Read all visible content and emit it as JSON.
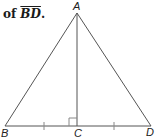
{
  "caption": {
    "prefix": "of ",
    "segment": "BD",
    "suffix": "."
  },
  "figure": {
    "type": "isosceles triangle with altitude",
    "points": {
      "A": {
        "label": "A",
        "x": 77,
        "y": 13
      },
      "B": {
        "label": "B",
        "x": 5,
        "y": 126
      },
      "C": {
        "label": "C",
        "x": 77,
        "y": 126
      },
      "D": {
        "label": "D",
        "x": 151,
        "y": 126
      }
    },
    "marks": {
      "right_angle_at": "C",
      "congruent_ticks": [
        "BC",
        "CD"
      ]
    },
    "line_color": "#555555"
  }
}
